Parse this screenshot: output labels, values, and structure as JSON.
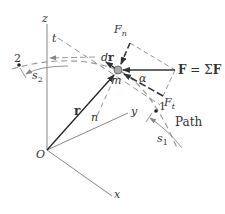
{
  "diagram": {
    "axes": {
      "origin_label": "O",
      "x_label": "x",
      "y_label": "y",
      "z_label": "z"
    },
    "particle": {
      "mass_label": "m",
      "position_vector_label": "r",
      "displacement_label": "dr",
      "displacement_d": "d",
      "displacement_r": "r"
    },
    "force": {
      "label_bold_F": "F",
      "label_equals": " = ",
      "label_sigma": "Σ",
      "label_bold_F2": "F",
      "normal_component": "F",
      "normal_sub": "n",
      "tangential_component": "F",
      "tangential_sub": "t",
      "angle_label": "α"
    },
    "path": {
      "label": "Path",
      "point_1": "1",
      "point_2": "2",
      "arc_1_label": "s",
      "arc_1_sub": "1",
      "arc_2_label": "s",
      "arc_2_sub": "2",
      "tangent_label": "t",
      "normal_label": "n"
    },
    "colors": {
      "line": "#333333",
      "axis": "#777777",
      "dashed": "#888888",
      "particle": "#999999"
    }
  }
}
